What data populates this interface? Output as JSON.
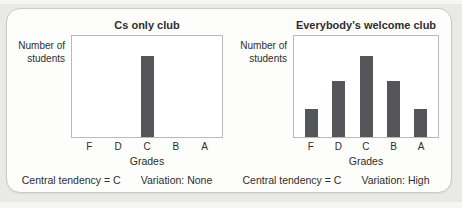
{
  "page": {
    "background": "#e9eae6",
    "top_strip_color": "#f6f7f4",
    "bottom_strip_color": "#f4f6f1",
    "card_background": "#fdfdfc",
    "card_border": "#c9cac5",
    "plot_border": "#b9bab5",
    "text_color": "#2e2e2e"
  },
  "chart_data": [
    {
      "type": "bar",
      "title": "Cs only club",
      "categories": [
        "F",
        "D",
        "C",
        "B",
        "A"
      ],
      "values": [
        0,
        0,
        8,
        0,
        0
      ],
      "xlabel": "Grades",
      "ylabel": "Number of students",
      "ylim": [
        0,
        10
      ],
      "grid": false,
      "legend": false,
      "y_ticks": "none (qualitative axis)",
      "bar_color": "#55565a",
      "annotations": [
        "Central tendency = C",
        "Variation: None"
      ]
    },
    {
      "type": "bar",
      "title": "Everybody's welcome club",
      "categories": [
        "F",
        "D",
        "C",
        "B",
        "A"
      ],
      "values": [
        2.8,
        5.5,
        8,
        5.5,
        2.8
      ],
      "xlabel": "Grades",
      "ylabel": "Number of students",
      "ylim": [
        0,
        10
      ],
      "grid": false,
      "legend": false,
      "y_ticks": "none (qualitative axis)",
      "bar_color": "#55565a",
      "annotations": [
        "Central tendency = C",
        "Variation: High"
      ]
    }
  ]
}
